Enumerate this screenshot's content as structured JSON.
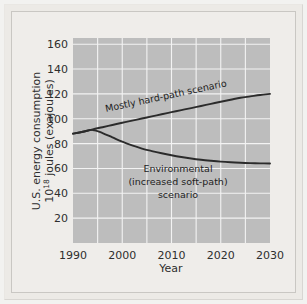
{
  "figure": {
    "background_color": "#efedea",
    "frame_color": "#c9c7c3"
  },
  "chart_data": {
    "type": "line",
    "title": "",
    "xlabel": "Year",
    "ylabel": "U.S. energy consumption 10^18 joules (exajoules)",
    "ylabel_line1": "U.S. energy consumption",
    "ylabel_line2_prefix": "10",
    "ylabel_line2_sup": "18",
    "ylabel_line2_rest": " joules (exajoules)",
    "xlim": [
      1990,
      2030
    ],
    "ylim": [
      0,
      165
    ],
    "xticks": [
      1990,
      2000,
      2010,
      2020,
      2030
    ],
    "xtick_labels": [
      "1990",
      "2000",
      "2010",
      "2020",
      "2030"
    ],
    "yticks": [
      20,
      40,
      60,
      80,
      100,
      120,
      140,
      160
    ],
    "ytick_labels": [
      "20",
      "40",
      "60",
      "80",
      "100",
      "120",
      "140",
      "160"
    ],
    "x_gridlines": [
      1995,
      2000,
      2005,
      2010,
      2015,
      2020,
      2025
    ],
    "y_gridlines": [
      20,
      40,
      60,
      80,
      100,
      120,
      140,
      160
    ],
    "grid": true,
    "legend": "inline-labels",
    "plot_background_color": "#bdbdbd",
    "gridline_color": "#f3f3f3",
    "line_color": "#2b2b2b",
    "series": [
      {
        "name": "Mostly hard-path scenario",
        "label": "Mostly hard-path scenario",
        "label_rotation_deg": -12,
        "x": [
          1990,
          1992,
          1994,
          1996,
          1998,
          2000,
          2002,
          2004,
          2006,
          2008,
          2010,
          2012,
          2014,
          2016,
          2018,
          2020,
          2022,
          2024,
          2026,
          2028,
          2030
        ],
        "values": [
          88,
          89.5,
          91.5,
          93.2,
          95.0,
          96.8,
          98.5,
          100.2,
          101.9,
          103.6,
          105.3,
          107.0,
          108.6,
          110.3,
          112.0,
          113.7,
          115.3,
          116.9,
          118.0,
          119.1,
          120
        ]
      },
      {
        "name": "Environmental (increased soft-path) scenario",
        "label_line1": "Environmental",
        "label_line2": "(increased soft-path)",
        "label_line3": "scenario",
        "x": [
          1990,
          1992,
          1994,
          1996,
          1998,
          2000,
          2002,
          2004,
          2006,
          2008,
          2010,
          2012,
          2014,
          2016,
          2018,
          2020,
          2022,
          2024,
          2026,
          2028,
          2030
        ],
        "values": [
          88,
          89.5,
          91.0,
          88.5,
          85.0,
          81.5,
          78.5,
          76.0,
          74.0,
          72.2,
          70.6,
          69.2,
          68.0,
          67.0,
          66.2,
          65.5,
          65.0,
          64.6,
          64.3,
          64.1,
          64
        ]
      }
    ]
  }
}
